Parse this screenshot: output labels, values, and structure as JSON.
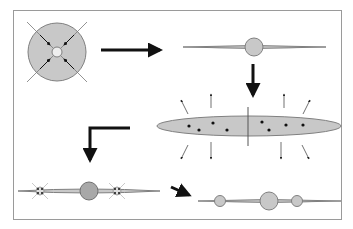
{
  "diagram": {
    "colors": {
      "fill": "#c8c8c8",
      "stroke": "#808080",
      "arrow": "#111111",
      "frame": "#9a9a9a",
      "dot": "#111111",
      "background": "#ffffff"
    },
    "stages": [
      {
        "id": "collapse",
        "label": "collapsing sphere with inward arrows"
      },
      {
        "id": "flattened-disk",
        "label": "thin disk with central bulge"
      },
      {
        "id": "expanding-disk",
        "label": "elliptical disk with dots and outward arrows"
      },
      {
        "id": "fragmenting-disk",
        "label": "disk with central bulge and two forming clumps"
      },
      {
        "id": "final-disk",
        "label": "disk with central bulge and two satellite clumps"
      }
    ],
    "transitions": [
      {
        "from": "collapse",
        "to": "flattened-disk",
        "direction": "right"
      },
      {
        "from": "flattened-disk",
        "to": "expanding-disk",
        "direction": "down"
      },
      {
        "from": "expanding-disk",
        "to": "fragmenting-disk",
        "direction": "left-down"
      },
      {
        "from": "fragmenting-disk",
        "to": "final-disk",
        "direction": "right-down"
      }
    ]
  }
}
